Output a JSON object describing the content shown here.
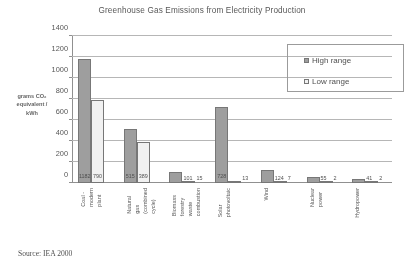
{
  "chart_data": {
    "type": "bar",
    "title": "Greenhouse Gas Emissions from Electricity Production",
    "xlabel": "",
    "ylabel": "grams CO2\nequivalent /\nkWh",
    "ylabel_lines": [
      "grams CO₂",
      "equivalent /",
      "kWh"
    ],
    "ylim": [
      0,
      1400
    ],
    "yticks": [
      0,
      200,
      400,
      600,
      800,
      1000,
      1200,
      1400
    ],
    "grid": true,
    "legend_position": "top-right",
    "categories": [
      "Coal -\nmodern plant",
      "Natural gas\n(combined\ncycle)",
      "Biomass\nforestry waste\ncombustion",
      "Solar\nphotovoltaic",
      "Wind",
      "Nuclear power",
      "Hydropower"
    ],
    "series": [
      {
        "name": "High range",
        "color": "#9d9d9d",
        "values": [
          1182,
          515,
          101,
          728,
          124,
          55,
          41
        ]
      },
      {
        "name": "Low range",
        "color": "#ffffff",
        "values": [
          790,
          389,
          15,
          13,
          7,
          2,
          2
        ]
      }
    ],
    "source": "Source: IEA 2000"
  },
  "legend": {
    "items": [
      {
        "label": "High range",
        "swatch": "high"
      },
      {
        "label": "Low range",
        "swatch": "low"
      }
    ]
  }
}
